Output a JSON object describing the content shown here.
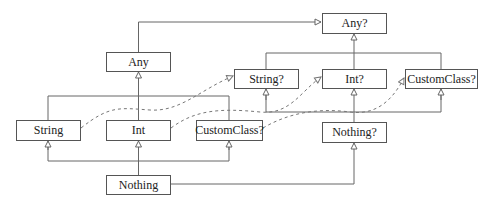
{
  "diagram": {
    "nodes": {
      "any_nullable": "Any?",
      "any": "Any",
      "string_nullable": "String?",
      "int_nullable": "Int?",
      "customclass_nullable_top": "CustomClass?",
      "string": "String",
      "int": "Int",
      "customclass_nullable_bottom": "CustomClass?",
      "nothing_nullable": "Nothing?",
      "nothing": "Nothing"
    },
    "edges": {
      "inheritance": [
        [
          "Any",
          "Any?"
        ],
        [
          "String?",
          "Any?"
        ],
        [
          "Int?",
          "Any?"
        ],
        [
          "CustomClass?",
          "Any?"
        ],
        [
          "String",
          "Any"
        ],
        [
          "Int",
          "Any"
        ],
        [
          "CustomClass?",
          "Any"
        ],
        [
          "Nothing?",
          "String?"
        ],
        [
          "Nothing?",
          "Int?"
        ],
        [
          "Nothing?",
          "CustomClass?"
        ],
        [
          "Nothing",
          "String"
        ],
        [
          "Nothing",
          "Int"
        ],
        [
          "Nothing",
          "CustomClass?"
        ],
        [
          "Nothing",
          "Nothing?"
        ]
      ],
      "dashed": [
        [
          "String",
          "String?"
        ],
        [
          "Int",
          "Int?"
        ],
        [
          "CustomClass?",
          "CustomClass?"
        ]
      ]
    },
    "colors": {
      "line": "#666666",
      "border": "#555555",
      "text": "#222222"
    }
  }
}
